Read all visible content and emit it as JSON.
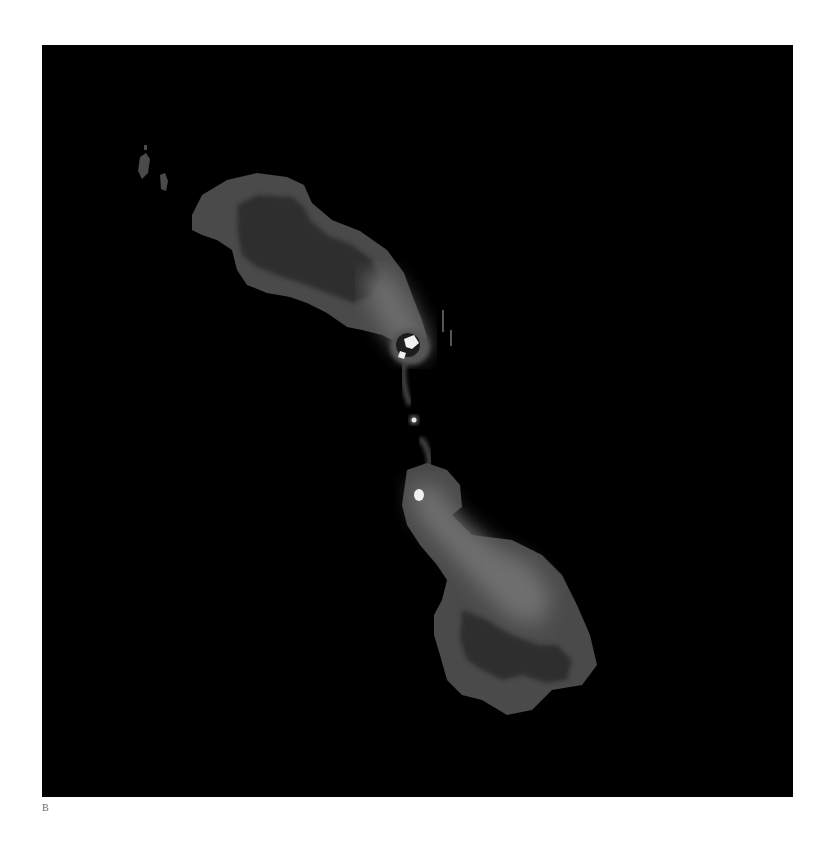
{
  "figure": {
    "panel_label": "B",
    "colors": {
      "background": "#000000",
      "outer_contour": "#4a4a4a",
      "inner_lobe": "#2e2e2e",
      "jet_glow": "#6e6e6e",
      "hotspot": "#f0f0f0"
    }
  }
}
